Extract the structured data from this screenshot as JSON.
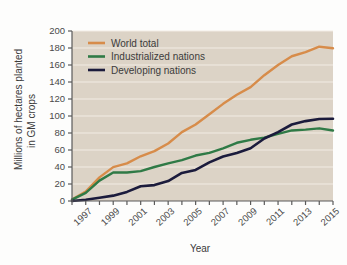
{
  "chart_data": {
    "type": "line",
    "title": "",
    "xlabel": "Year",
    "ylabel": "Millions of hectares planted in GM crops",
    "ylabel_line1": "Millions of hectares planted",
    "ylabel_line2": "in GM crops",
    "xlim": [
      1996,
      2015
    ],
    "ylim": [
      0,
      200
    ],
    "ytick_step": 20,
    "grid": true,
    "grid_axis": "y",
    "legend_position": "top-left",
    "x": [
      1996,
      1997,
      1998,
      1999,
      2000,
      2001,
      2002,
      2003,
      2004,
      2005,
      2006,
      2007,
      2008,
      2009,
      2010,
      2011,
      2012,
      2013,
      2014,
      2015
    ],
    "yticks": [
      0,
      20,
      40,
      60,
      80,
      100,
      120,
      140,
      160,
      180,
      200
    ],
    "ytick_labels": [
      "0",
      "20",
      "40",
      "60",
      "80",
      "100",
      "120",
      "140",
      "160",
      "180",
      "200"
    ],
    "xticks": [
      1996,
      1997,
      1998,
      1999,
      2000,
      2001,
      2002,
      2003,
      2004,
      2005,
      2006,
      2007,
      2008,
      2009,
      2010,
      2011,
      2012,
      2013,
      2014,
      2015
    ],
    "xtick_labels": [
      "1997",
      "1999",
      "2001",
      "2003",
      "2005",
      "2007",
      "2009",
      "2011",
      "2013",
      "2015"
    ],
    "xtick_label_years": [
      1997,
      1999,
      2001,
      2003,
      2005,
      2007,
      2009,
      2011,
      2013,
      2015
    ],
    "series": [
      {
        "name": "World total",
        "color": "#d78c4a",
        "values": [
          1.7,
          11,
          27.8,
          39.9,
          44.2,
          52.6,
          58.7,
          67.7,
          81,
          90,
          102,
          114.3,
          125,
          134,
          148,
          160,
          170.3,
          175.2,
          181.5,
          179.7
        ]
      },
      {
        "name": "Industrialized nations",
        "color": "#2f7a46",
        "values": [
          1.7,
          9.5,
          24,
          33.6,
          33.5,
          35.2,
          40,
          44.3,
          48,
          53.5,
          56.6,
          62,
          68.5,
          72,
          74.5,
          79,
          83,
          84,
          85.5,
          83
        ]
      },
      {
        "name": "Developing nations",
        "color": "#1b1b3c",
        "values": [
          0,
          1.5,
          3.8,
          6.3,
          10.7,
          17.4,
          18.7,
          23.4,
          33,
          36.5,
          45.4,
          52.3,
          56.5,
          62,
          73.5,
          81,
          90,
          94,
          96.5,
          96.7
        ]
      }
    ]
  },
  "colors": {
    "background": "#fdfdfc",
    "plot_background": "#dcd3c6",
    "gridline": "#f2ece4",
    "axis": "#5a5a5a",
    "text": "#3b3b3b",
    "world_total": "#d78c4a",
    "industrialized": "#2f7a46",
    "developing": "#1b1b3c"
  },
  "legend": {
    "items": [
      {
        "label": "World total",
        "color": "#d78c4a"
      },
      {
        "label": "Industrialized nations",
        "color": "#2f7a46"
      },
      {
        "label": "Developing nations",
        "color": "#1b1b3c"
      }
    ]
  }
}
